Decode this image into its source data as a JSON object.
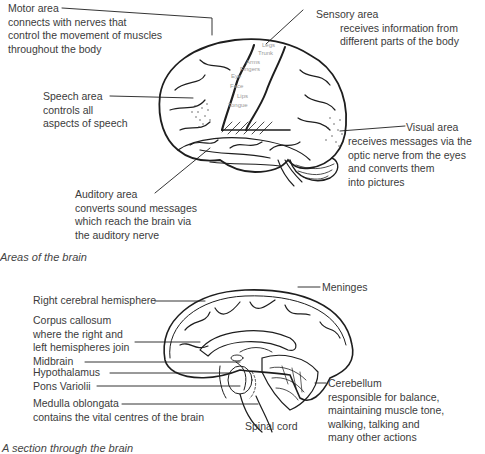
{
  "figure1": {
    "caption": "Areas of the brain",
    "labels": {
      "motor": {
        "title": "Motor area",
        "lines": [
          "connects with nerves that",
          "control the movement of muscles",
          "throughout the body"
        ]
      },
      "sensory": {
        "title": "Sensory area",
        "lines": [
          "receives information from",
          "different parts of the body"
        ]
      },
      "speech": {
        "title": "Speech area",
        "lines": [
          "controls all",
          "aspects of speech"
        ]
      },
      "visual": {
        "title": "Visual area",
        "lines": [
          "receives messages via the",
          "optic nerve from the eyes",
          "and converts them",
          "into pictures"
        ]
      },
      "auditory": {
        "title": "Auditory area",
        "lines": [
          "converts sound messages",
          "which reach the brain via",
          "the auditory nerve"
        ]
      }
    },
    "body_parts": [
      "Legs",
      "Trunk",
      "Arms",
      "Fingers",
      "Eye",
      "Face",
      "Lips",
      "Tongue"
    ]
  },
  "figure2": {
    "caption": "A section through the brain",
    "labels": {
      "hemisphere": "Right cerebral hemisphere",
      "corpus": {
        "title": "Corpus callosum",
        "lines": [
          "where the right and",
          "left hemispheres join"
        ]
      },
      "midbrain": "Midbrain",
      "hypothalamus": "Hypothalamus",
      "pons": "Pons Variolii",
      "medulla": {
        "title": "Medulla oblongata",
        "lines": [
          "contains the vital centres of the brain"
        ]
      },
      "spinal": "Spinal cord",
      "meninges": "Meninges",
      "cerebellum": {
        "title": "Cerebellum",
        "lines": [
          "responsible for balance,",
          "maintaining muscle tone,",
          "walking, talking and",
          "many other actions"
        ]
      }
    }
  }
}
